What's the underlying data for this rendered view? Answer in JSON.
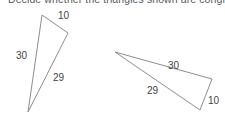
{
  "prompt": {
    "text": "Decide whether the triangles shown are congruent."
  },
  "figure": {
    "stroke_color": "#8d8d8d",
    "fill_color": "#ffffff",
    "label_color": "#3f3f3f",
    "background": "#ffffff",
    "triangles": [
      {
        "name": "left-triangle",
        "points": "42,15 68,33 28,112",
        "labels": {
          "top": "10",
          "left": "30",
          "right": "29"
        }
      },
      {
        "name": "right-triangle",
        "points": "115,52 212,79 200,110",
        "labels": {
          "top": "30",
          "left": "29",
          "right": "10"
        }
      }
    ]
  }
}
